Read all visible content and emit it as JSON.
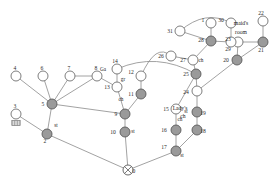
{
  "figure": {
    "type": "node-link-diagram",
    "width": 280,
    "height": 188,
    "background": "#ffffff",
    "node_fill_open": "#ffffff",
    "node_fill_filled": "#9a9a9a",
    "node_stroke": "#5a5a5a",
    "edge_stroke": "#8a8a8a"
  },
  "nodes": [
    {
      "id": "0",
      "label": "0",
      "x": 128,
      "y": 170,
      "style": "cross",
      "label_dx": 6,
      "label_dy": 3
    },
    {
      "id": "2",
      "label": "2",
      "x": 47,
      "y": 134,
      "style": "filled",
      "label_dx": -2,
      "label_dy": 9
    },
    {
      "id": "3",
      "label": "3",
      "x": 16,
      "y": 114,
      "style": "hatched",
      "label_dx": -1,
      "label_dy": -6
    },
    {
      "id": "4",
      "label": "4",
      "x": 16,
      "y": 76,
      "style": "open",
      "label_dx": -1,
      "label_dy": -6
    },
    {
      "id": "5",
      "label": "5",
      "x": 52,
      "y": 104,
      "style": "filled",
      "label_dx": -9,
      "label_dy": 2
    },
    {
      "id": "6",
      "label": "6",
      "x": 43,
      "y": 76,
      "style": "open",
      "label_dx": -1,
      "label_dy": -6
    },
    {
      "id": "7",
      "label": "7",
      "x": 70,
      "y": 76,
      "style": "open",
      "label_dx": -1,
      "label_dy": -6
    },
    {
      "id": "8",
      "label": "8",
      "x": 97,
      "y": 76,
      "style": "open",
      "label_dx": -1,
      "label_dy": -6
    },
    {
      "id": "9",
      "label": "9",
      "x": 125,
      "y": 114,
      "style": "filled",
      "label_dx": -9,
      "label_dy": 2
    },
    {
      "id": "10",
      "label": "10",
      "x": 125,
      "y": 132,
      "style": "filled",
      "label_dx": -12,
      "label_dy": 2
    },
    {
      "id": "11",
      "label": "11",
      "x": 141,
      "y": 94,
      "style": "filled",
      "label_dx": -10,
      "label_dy": 2
    },
    {
      "id": "12",
      "label": "12",
      "x": 141,
      "y": 76,
      "style": "open",
      "label_dx": -10,
      "label_dy": -2
    },
    {
      "id": "13",
      "label": "13",
      "x": 117,
      "y": 87,
      "style": "open",
      "label_dx": -10,
      "label_dy": 2
    },
    {
      "id": "14",
      "label": "14",
      "x": 117,
      "y": 69,
      "style": "open",
      "label_dx": -2,
      "label_dy": -6
    },
    {
      "id": "15",
      "label": "15",
      "x": 176,
      "y": 109,
      "style": "open",
      "label_dx": -10,
      "label_dy": 2
    },
    {
      "id": "16",
      "label": "16",
      "x": 176,
      "y": 130,
      "style": "filled",
      "label_dx": -12,
      "label_dy": 2
    },
    {
      "id": "17",
      "label": "17",
      "x": 176,
      "y": 151,
      "style": "filled",
      "label_dx": -12,
      "label_dy": -2
    },
    {
      "id": "18",
      "label": "18",
      "x": 197,
      "y": 130,
      "style": "filled",
      "label_dx": 6,
      "label_dy": 3
    },
    {
      "id": "19",
      "label": "19",
      "x": 197,
      "y": 112,
      "style": "filled",
      "label_dx": 6,
      "label_dy": 3
    },
    {
      "id": "20",
      "label": "20",
      "x": 237,
      "y": 60,
      "style": "filled",
      "label_dx": -11,
      "label_dy": 2
    },
    {
      "id": "21",
      "label": "21",
      "x": 263,
      "y": 42,
      "style": "filled",
      "label_dx": -2,
      "label_dy": 10
    },
    {
      "id": "22",
      "label": "22",
      "x": 263,
      "y": 21,
      "style": "open",
      "label_dx": -2,
      "label_dy": -6
    },
    {
      "id": "23",
      "label": "23",
      "x": 238,
      "y": 42,
      "style": "open",
      "label_dx": -10,
      "label_dy": -1
    },
    {
      "id": "24",
      "label": "24",
      "x": 197,
      "y": 91,
      "style": "open",
      "label_dx": -11,
      "label_dy": 3
    },
    {
      "id": "25",
      "label": "25",
      "x": 196,
      "y": 74,
      "style": "filled",
      "label_dx": -10,
      "label_dy": 2
    },
    {
      "id": "26",
      "label": "26",
      "x": 171,
      "y": 56,
      "style": "open",
      "label_dx": -10,
      "label_dy": 2
    },
    {
      "id": "27",
      "label": "27",
      "x": 193,
      "y": 60,
      "style": "open",
      "label_dx": -10,
      "label_dy": 2
    },
    {
      "id": "28",
      "label": "28",
      "x": 211,
      "y": 41,
      "style": "filled",
      "label_dx": -10,
      "label_dy": 1
    },
    {
      "id": "29",
      "label": "29",
      "x": 231,
      "y": 42,
      "style": "open",
      "label_dx": -3,
      "label_dy": 9
    },
    {
      "id": "30",
      "label": "30",
      "x": 231,
      "y": 23,
      "style": "open",
      "label_dx": -10,
      "label_dy": -1
    },
    {
      "id": "31",
      "label": "31",
      "x": 180,
      "y": 31,
      "style": "open",
      "label_dx": -10,
      "label_dy": 2
    },
    {
      "id": "1",
      "label": "1",
      "x": 211,
      "y": 23,
      "style": "open",
      "label_dx": -8,
      "label_dy": -1
    }
  ],
  "edges": [
    {
      "from": "4",
      "to": "5"
    },
    {
      "from": "6",
      "to": "5"
    },
    {
      "from": "7",
      "to": "5"
    },
    {
      "from": "7",
      "to": "8"
    },
    {
      "from": "8",
      "to": "5"
    },
    {
      "from": "8",
      "to": "13"
    },
    {
      "from": "3",
      "to": "2"
    },
    {
      "from": "5",
      "to": "2"
    },
    {
      "from": "5",
      "to": "9"
    },
    {
      "from": "2",
      "to": "0"
    },
    {
      "from": "14",
      "to": "13"
    },
    {
      "from": "13",
      "to": "9"
    },
    {
      "from": "11",
      "to": "9"
    },
    {
      "from": "12",
      "to": "11"
    },
    {
      "from": "9",
      "to": "10"
    },
    {
      "from": "10",
      "to": "0"
    },
    {
      "from": "0",
      "to": "17"
    },
    {
      "from": "15",
      "to": "16"
    },
    {
      "from": "16",
      "to": "17"
    },
    {
      "from": "17",
      "to": "18"
    },
    {
      "from": "18",
      "to": "19"
    },
    {
      "from": "19",
      "to": "24"
    },
    {
      "from": "24",
      "to": "25"
    },
    {
      "from": "25",
      "to": "15"
    },
    {
      "from": "25",
      "to": "27"
    },
    {
      "from": "26",
      "to": "27"
    },
    {
      "from": "27",
      "to": "28"
    },
    {
      "from": "28",
      "to": "31"
    },
    {
      "from": "28",
      "to": "1"
    },
    {
      "from": "28",
      "to": "29"
    },
    {
      "from": "29",
      "to": "30"
    },
    {
      "from": "29",
      "to": "23"
    },
    {
      "from": "23",
      "to": "21"
    },
    {
      "from": "23",
      "to": "20"
    },
    {
      "from": "20",
      "to": "21"
    },
    {
      "from": "21",
      "to": "22"
    },
    {
      "from": "20",
      "to": "24"
    }
  ],
  "curved_edges": [
    {
      "from": "14",
      "to": "25",
      "label": "arc-14-25"
    },
    {
      "from": "31",
      "to": "30",
      "label": "arc-31-30"
    },
    {
      "from": "26",
      "to": "12",
      "label": "arc-26-12"
    }
  ],
  "annotations": [
    {
      "id": "st-2",
      "text": "st",
      "x": 56,
      "y": 127
    },
    {
      "id": "Ga-14",
      "text": "Ga",
      "x": 103,
      "y": 71
    },
    {
      "id": "gr-13",
      "text": "gr",
      "x": 123,
      "y": 81
    },
    {
      "id": "ch-13",
      "text": "ch",
      "x": 121,
      "y": 101
    },
    {
      "id": "st-10",
      "text": "st",
      "x": 133,
      "y": 133
    },
    {
      "id": "ch-16",
      "text": "ch",
      "x": 180,
      "y": 121
    },
    {
      "id": "st-17",
      "text": "st",
      "x": 182,
      "y": 157
    },
    {
      "id": "st-19",
      "text": "st",
      "x": 186,
      "y": 113
    },
    {
      "id": "ch-27",
      "text": "ch",
      "x": 201,
      "y": 62
    },
    {
      "id": "ladys-ch-1",
      "text": "Lady's",
      "x": 180,
      "y": 110
    },
    {
      "id": "ladys-ch-2",
      "text": "ch",
      "x": 183,
      "y": 118
    },
    {
      "id": "maids-1",
      "text": "maid's",
      "x": 241,
      "y": 25
    },
    {
      "id": "maids-2",
      "text": "room",
      "x": 241,
      "y": 34
    }
  ]
}
